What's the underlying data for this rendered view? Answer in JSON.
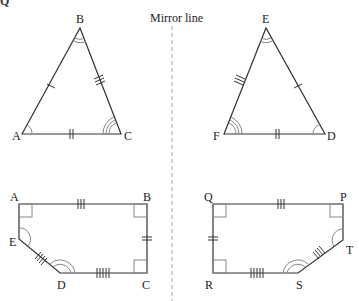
{
  "header": {
    "cut_text": "Q"
  },
  "mirror": {
    "label": "Mirror line",
    "x": 172,
    "color": "#aaaaaa"
  },
  "colors": {
    "stroke": "#333333",
    "mark": "#555555",
    "angle": "#888888",
    "label": "#222222"
  },
  "triangles": [
    {
      "name": "ABC",
      "vertices": {
        "A": [
          22,
          134
        ],
        "B": [
          80,
          28
        ],
        "C": [
          121,
          134
        ]
      },
      "labels": {
        "A": "A",
        "B": "B",
        "C": "C"
      }
    },
    {
      "name": "EFD",
      "vertices": {
        "E": [
          266,
          28
        ],
        "F": [
          224,
          134
        ],
        "D": [
          325,
          134
        ]
      },
      "labels": {
        "E": "E",
        "F": "F",
        "D": "D"
      }
    }
  ],
  "pentagons": [
    {
      "name": "ABCDE",
      "vertices": {
        "A": [
          19,
          204
        ],
        "B": [
          147,
          204
        ],
        "C": [
          147,
          273
        ],
        "D": [
          60,
          273
        ],
        "E": [
          19,
          239
        ]
      },
      "labels": {
        "A": "A",
        "B": "B",
        "C": "C",
        "D": "D",
        "E": "E"
      }
    },
    {
      "name": "PQRST",
      "vertices": {
        "Q": [
          213,
          204
        ],
        "P": [
          343,
          204
        ],
        "T": [
          343,
          240
        ],
        "S": [
          298,
          273
        ],
        "R": [
          213,
          273
        ]
      },
      "labels": {
        "Q": "Q",
        "P": "P",
        "T": "T",
        "S": "S",
        "R": "R"
      }
    }
  ]
}
